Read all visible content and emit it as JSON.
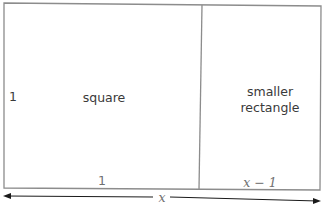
{
  "diagram": {
    "square_label": "square",
    "rect_label_line1": "smaller",
    "rect_label_line2": "rectangle",
    "left_side_label": "1",
    "square_bottom_label": "1",
    "rect_bottom_label": "x − 1",
    "total_width_label": "x",
    "colors": {
      "border": "#8c8c8c",
      "text": "#3a3a3a",
      "arrow": "#1a1a1a"
    }
  }
}
